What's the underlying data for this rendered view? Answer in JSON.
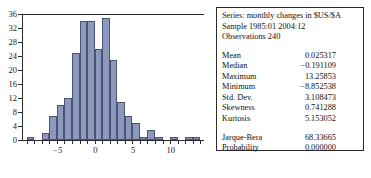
{
  "chart_data": {
    "type": "bar",
    "title": "",
    "xlabel": "",
    "ylabel": "",
    "grid": false,
    "legend": "none",
    "xlim": [
      -9.6,
      14.4
    ],
    "ylim": [
      0,
      36
    ],
    "xticks": [
      -5,
      0,
      5,
      10
    ],
    "xtick_labels": [
      "−5",
      "0",
      "5",
      "10"
    ],
    "yticks": [
      0,
      4,
      8,
      12,
      16,
      20,
      24,
      28,
      32,
      36
    ],
    "ytick_labels": [
      "0",
      "4",
      "8",
      "12",
      "16",
      "20",
      "24",
      "28",
      "32",
      "36"
    ],
    "bin_width": 1,
    "bin_centers": [
      -8.6,
      -7.6,
      -6.6,
      -5.6,
      -4.6,
      -3.6,
      -2.6,
      -1.6,
      -0.6,
      0.4,
      1.4,
      2.4,
      3.4,
      4.4,
      5.4,
      6.4,
      7.4,
      8.4,
      9.4,
      10.4,
      11.4,
      12.4,
      13.4
    ],
    "categories": [
      "-8.6",
      "-7.6",
      "-6.6",
      "-5.6",
      "-4.6",
      "-3.6",
      "-2.6",
      "-1.6",
      "-0.6",
      "0.4",
      "1.4",
      "2.4",
      "3.4",
      "4.4",
      "5.4",
      "6.4",
      "7.4",
      "8.4",
      "9.4",
      "10.4",
      "11.4",
      "12.4",
      "13.4"
    ],
    "values": [
      1,
      0,
      2,
      7,
      10,
      12,
      25,
      34,
      34,
      26,
      35,
      23,
      11,
      7,
      5,
      1,
      3,
      1,
      0,
      1,
      0,
      1,
      1
    ],
    "bar_fill_color": "#8c99bd",
    "bar_edge_color": "#4a5575",
    "axis_color": "#2b2b2b"
  },
  "stats": {
    "header": {
      "series_line": "Series: monthly changes in $US/$A",
      "sample_line": "Sample 1985:01 2004:12",
      "observations_line": "Observations 240"
    },
    "rows": [
      {
        "label": "Mean",
        "value": "0.025317"
      },
      {
        "label": "Median",
        "value": "−0.191109"
      },
      {
        "label": "Maximum",
        "value": "13.25853"
      },
      {
        "label": "Minimum",
        "value": "−8.852538"
      },
      {
        "label": "Std. Dev.",
        "value": "3.108473"
      },
      {
        "label": "Skewness",
        "value": "0.741288"
      },
      {
        "label": "Kurtosis",
        "value": "5.153052"
      }
    ],
    "test_rows": [
      {
        "label": "Jarque-Bera",
        "value": "68.33665"
      },
      {
        "label": "Probability",
        "value": "0.000000"
      }
    ]
  }
}
